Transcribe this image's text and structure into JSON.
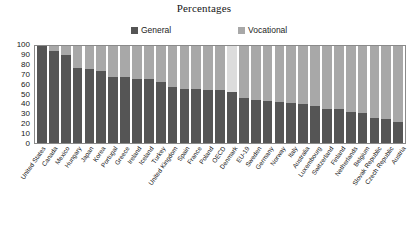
{
  "chart_data": {
    "type": "bar",
    "title": "Percentages",
    "subtitle": "",
    "xlabel": "",
    "ylabel": "",
    "ylim": [
      0,
      100
    ],
    "yticks": [
      100,
      90,
      80,
      70,
      60,
      50,
      40,
      30,
      20,
      10,
      0
    ],
    "grid": false,
    "stacked": true,
    "stack_total": 100,
    "legend_position": "top",
    "legend": [
      "General",
      "Vocational"
    ],
    "colors": {
      "general": "#555555",
      "vocational": "#a8a8a8",
      "vocational_highlight": "#dcdcdc",
      "frame": "#8a8a8a",
      "background": "#ffffff"
    },
    "categories": [
      "United States",
      "Canada",
      "Mexico",
      "Hungary",
      "Japan",
      "Korea",
      "Portugal",
      "Greece",
      "Ireland",
      "Iceland",
      "Turkey",
      "United Kingdom",
      "Spain",
      "France",
      "Poland",
      "OECD",
      "Denmark",
      "EU-19",
      "Sweden",
      "Germany",
      "Norway",
      "Italy",
      "Australia",
      "Luxembourg",
      "Switzerland",
      "Finland",
      "Netherlands",
      "Belgium",
      "Slovak Republic",
      "Czech Republic",
      "Austria"
    ],
    "series": [
      {
        "name": "General",
        "values": [
          100,
          95,
          91,
          77,
          76,
          74,
          68,
          68,
          66,
          66,
          63,
          58,
          56,
          56,
          55,
          55,
          53,
          46,
          44,
          43,
          42,
          41,
          40,
          38,
          35,
          35,
          32,
          31,
          26,
          25,
          22
        ]
      },
      {
        "name": "Vocational",
        "values": [
          0,
          5,
          9,
          23,
          24,
          26,
          32,
          32,
          34,
          34,
          37,
          42,
          44,
          44,
          45,
          45,
          47,
          54,
          56,
          57,
          58,
          59,
          60,
          62,
          65,
          65,
          68,
          69,
          74,
          75,
          78
        ]
      }
    ],
    "highlight_categories": [
      "Denmark"
    ]
  }
}
